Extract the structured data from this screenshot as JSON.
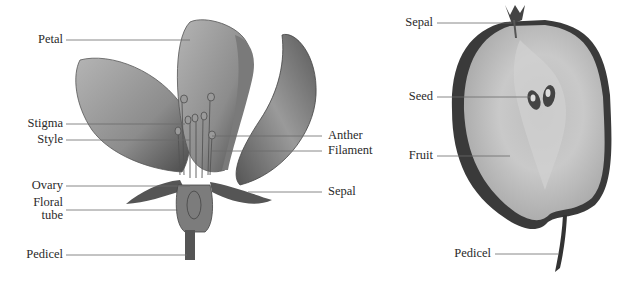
{
  "flower": {
    "labels": {
      "petal": "Petal",
      "stigma": "Stigma",
      "style": "Style",
      "ovary": "Ovary",
      "floral_tube_1": "Floral",
      "floral_tube_2": "tube",
      "pedicel": "Pedicel",
      "anther": "Anther",
      "filament": "Filament",
      "sepal": "Sepal"
    }
  },
  "fruit": {
    "labels": {
      "sepal": "Sepal",
      "seed": "Seed",
      "fruit": "Fruit",
      "pedicel": "Pedicel"
    }
  },
  "colors": {
    "leader_line": "#6a6a6a",
    "illustration_dark": "#3a3a3a",
    "illustration_mid": "#8a8a8a",
    "illustration_light": "#c8c8c8"
  }
}
